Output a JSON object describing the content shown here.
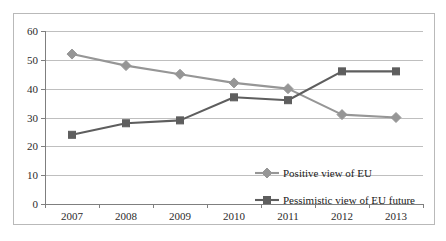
{
  "chart_data": {
    "type": "line",
    "title": "",
    "subtitle": "",
    "xlabel": "",
    "ylabel": "",
    "categories": [
      "2007",
      "2008",
      "2009",
      "2010",
      "2011",
      "2012",
      "2013"
    ],
    "x": [
      2007,
      2008,
      2009,
      2010,
      2011,
      2012,
      2013
    ],
    "ylim": [
      0,
      60
    ],
    "yticks": [
      0,
      10,
      20,
      30,
      40,
      50,
      60
    ],
    "ytick_labels": [
      "0",
      "10",
      "20",
      "30",
      "40",
      "50",
      "60"
    ],
    "grid": true,
    "grid_axis": "y",
    "legend_position": "inside-lower-right",
    "series": [
      {
        "name": "Positive view of EU",
        "values": [
          52,
          48,
          45,
          42,
          40,
          31,
          30
        ],
        "color": "#969696",
        "marker": "diamond"
      },
      {
        "name": "Pessimistic view of EU future",
        "values": [
          24,
          28,
          29,
          37,
          36,
          46,
          46
        ],
        "color": "#5e5e5e",
        "marker": "square"
      }
    ]
  },
  "style": {
    "frame_border_color": "#b9b9b9",
    "gridline_color": "#bfbfbf",
    "axis_color": "#7f7f7f",
    "tick_label_color": "#2b2b2b",
    "legend_text_color": "#1a1a1a",
    "background": "#ffffff"
  },
  "legend": {
    "entries": [
      {
        "label": "Positive view of EU",
        "color": "#969696",
        "marker": "diamond"
      },
      {
        "label": "Pessimistic view of EU future",
        "color": "#5e5e5e",
        "marker": "square"
      }
    ]
  }
}
